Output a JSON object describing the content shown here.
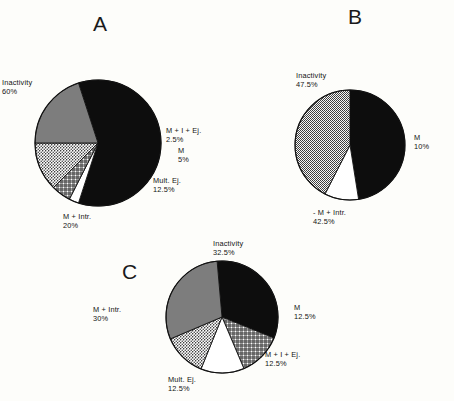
{
  "figure": {
    "background": "#fdfdfa",
    "ink": "#141414"
  },
  "panels": [
    {
      "letter": "A",
      "letter_pos": {
        "x": 93,
        "y": 12
      },
      "center": {
        "x": 98,
        "y": 143
      },
      "radius": 63,
      "start_angle": -108,
      "labels": [
        {
          "text": "Inactivity\n60%",
          "x": 2,
          "y": 78,
          "align": "l"
        },
        {
          "text": "M + I + Ej.\n2.5%",
          "x": 166,
          "y": 126,
          "align": "l"
        },
        {
          "text": "M\n5%",
          "x": 178,
          "y": 146,
          "align": "l"
        },
        {
          "text": "Mult. Ej.\n12.5%",
          "x": 153,
          "y": 176,
          "align": "l"
        },
        {
          "text": "M + Intr.\n20%",
          "x": 63,
          "y": 212,
          "align": "l"
        }
      ]
    },
    {
      "letter": "B",
      "letter_pos": {
        "x": 348,
        "y": 5
      },
      "center": {
        "x": 350,
        "y": 145
      },
      "radius": 55,
      "start_angle": -90,
      "labels": [
        {
          "text": "Inactivity\n47.5%",
          "x": 296,
          "y": 71,
          "align": "l"
        },
        {
          "text": "M\n10%",
          "x": 414,
          "y": 133,
          "align": "l"
        },
        {
          "text": "- M + Intr.\n42.5%",
          "x": 313,
          "y": 208,
          "align": "l"
        }
      ]
    },
    {
      "letter": "C",
      "letter_pos": {
        "x": 122,
        "y": 260
      },
      "center": {
        "x": 222,
        "y": 317
      },
      "radius": 56,
      "start_angle": -95,
      "labels": [
        {
          "text": "Inactivity\n32.5%",
          "x": 213,
          "y": 239,
          "align": "l"
        },
        {
          "text": "M\n12.5%",
          "x": 294,
          "y": 303,
          "align": "l"
        },
        {
          "text": "M + I + Ej.\n12.5%",
          "x": 265,
          "y": 350,
          "align": "l"
        },
        {
          "text": "Mult. Ej.\n12.5%",
          "x": 168,
          "y": 375,
          "align": "l"
        },
        {
          "text": "M + Intr.\n30%",
          "x": 93,
          "y": 305,
          "align": "l"
        }
      ]
    }
  ],
  "chart_data": [
    {
      "type": "pie",
      "title": "A",
      "labels": [
        "Inactivity",
        "M + I + Ej.",
        "M",
        "Mult. Ej.",
        "M + Intr."
      ],
      "values": [
        60,
        2.5,
        5,
        12.5,
        20
      ],
      "value_labels": [
        "60%",
        "2.5%",
        "5%",
        "12.5%",
        "20%"
      ],
      "fills": [
        "solid-black",
        "white",
        "crosshatch",
        "stipple-light",
        "solid-gray"
      ],
      "legend": "inline-labels"
    },
    {
      "type": "pie",
      "title": "B",
      "labels": [
        "Inactivity",
        "M",
        "M + Intr."
      ],
      "values": [
        47.5,
        10,
        42.5
      ],
      "value_labels": [
        "47.5%",
        "10%",
        "42.5%"
      ],
      "fills": [
        "solid-black",
        "white",
        "stipple-gray"
      ],
      "legend": "inline-labels"
    },
    {
      "type": "pie",
      "title": "C",
      "labels": [
        "Inactivity",
        "M",
        "M + I + Ej.",
        "Mult. Ej.",
        "M + Intr."
      ],
      "values": [
        32.5,
        12.5,
        12.5,
        12.5,
        30
      ],
      "value_labels": [
        "32.5%",
        "12.5%",
        "12.5%",
        "12.5%",
        "30%"
      ],
      "fills": [
        "solid-black",
        "crosshatch",
        "white",
        "stipple-light",
        "solid-gray"
      ],
      "legend": "inline-labels"
    }
  ]
}
